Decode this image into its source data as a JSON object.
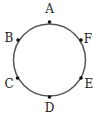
{
  "diagram": {
    "type": "circle-with-points",
    "circle": {
      "cx": 49.5,
      "cy": 60,
      "r": 36,
      "stroke": "#555555",
      "stroke_width": 1.5
    },
    "point_color": "#111111",
    "label_color": "#222222",
    "points": [
      {
        "id": "A",
        "label": "A",
        "x": 49.5,
        "y": 22,
        "lx": 49.5,
        "ly": 13
      },
      {
        "id": "B",
        "label": "B",
        "x": 18,
        "y": 40,
        "lx": 9,
        "ly": 42
      },
      {
        "id": "C",
        "label": "C",
        "x": 17.5,
        "y": 78,
        "lx": 9,
        "ly": 88
      },
      {
        "id": "D",
        "label": "D",
        "x": 49.5,
        "y": 97,
        "lx": 49.5,
        "ly": 112
      },
      {
        "id": "E",
        "label": "E",
        "x": 81,
        "y": 78,
        "lx": 89,
        "ly": 88
      },
      {
        "id": "F",
        "label": "F",
        "x": 81,
        "y": 40,
        "lx": 88,
        "ly": 43
      }
    ]
  }
}
